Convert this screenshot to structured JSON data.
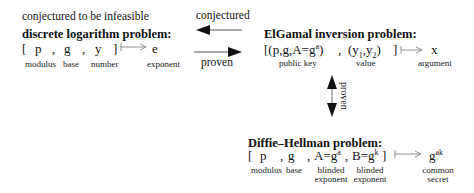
{
  "caption_left": "conjectured to be infeasible",
  "arrows": {
    "top_label": "conjectured",
    "bottom_label": "proven",
    "vertical_label": "proven"
  },
  "dlog": {
    "title": "discrete logarithm problem:",
    "open": "[",
    "p": "p",
    "g": "g",
    "y": "y",
    "close": "]",
    "comma": ",",
    "output": "e",
    "labels": {
      "modulus": "modulus",
      "base": "base",
      "number": "number",
      "exponent": "exponent"
    }
  },
  "elgamal": {
    "title": "ElGamal inversion problem:",
    "key_prefix": "[(p,g,A=g",
    "key_sup": "a",
    "key_suffix": ")",
    "comma": ",",
    "val_prefix": "(y",
    "val_sub1": "1",
    "val_mid": ",y",
    "val_sub2": "2",
    "val_suffix": ")",
    "close": "]",
    "output": "x",
    "labels": {
      "public_key": "public key",
      "value": "value",
      "argument": "argument"
    }
  },
  "dh": {
    "title": "Diffie–Hellman problem:",
    "open": "[",
    "p": "p",
    "g": "g",
    "A_prefix": "A=g",
    "A_sup": "a",
    "B_prefix": "B=g",
    "B_sup": "k",
    "close": "]",
    "comma": ",",
    "output_base": "g",
    "output_sup": "ak",
    "labels": {
      "modulus": "modulus",
      "base": "base",
      "blinded1_line1": "blinded",
      "blinded1_line2": "exponent",
      "blinded2_line1": "blinded",
      "blinded2_line2": "exponent",
      "common_line1": "common",
      "common_line2": "secret"
    }
  }
}
